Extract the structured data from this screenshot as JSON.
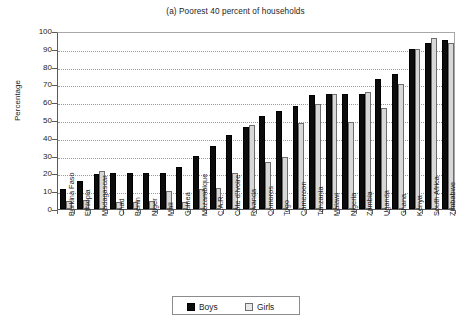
{
  "chart_data": {
    "type": "bar",
    "title": "(a) Poorest 40 percent of households",
    "xlabel": "",
    "ylabel": "Percentage",
    "ylim": [
      0,
      100
    ],
    "ytick_step": 10,
    "yticks": [
      0,
      10,
      20,
      30,
      40,
      50,
      60,
      70,
      80,
      90,
      100
    ],
    "grid": true,
    "legend_position": "bottom-center",
    "categories": [
      "Burkina Faso",
      "Ethiopia",
      "Madagascar",
      "Chad",
      "Benin",
      "Niger",
      "Mali",
      "Guinea",
      "Mozambique",
      "C.A.R.",
      "Côte d'Ivoire",
      "Rwanda",
      "Comoros",
      "Togo",
      "Cameroon",
      "Tanzania",
      "Malawi",
      "Nigeria",
      "Zambia",
      "Uganda",
      "Ghana",
      "Kenya",
      "South Africa",
      "Zimbabwe"
    ],
    "series": [
      {
        "name": "Boys",
        "color": "#0c0c0c",
        "values": [
          11.0,
          15.8,
          19.7,
          20.1,
          20.5,
          20.5,
          20.5,
          23.6,
          30.0,
          35.6,
          41.8,
          46.2,
          52.4,
          55.0,
          57.6,
          64.3,
          64.4,
          64.4,
          64.8,
          73.2,
          76.0,
          90.0,
          93.2,
          95.2
        ]
      },
      {
        "name": "Girls",
        "color": "#d8d8d8",
        "values": [
          4.7,
          5.1,
          21.6,
          3.8,
          3.9,
          4.7,
          10.4,
          4.0,
          11.0,
          12.0,
          20.5,
          47.4,
          26.3,
          29.5,
          48.5,
          58.9,
          64.7,
          48.7,
          65.5,
          57.0,
          70.4,
          90.1,
          96.2,
          93.3
        ]
      }
    ]
  },
  "legend": {
    "entries": [
      {
        "label": "Boys",
        "swatch": "black-square-icon"
      },
      {
        "label": "Girls",
        "swatch": "light-square-icon"
      }
    ]
  },
  "axis": {
    "y_title": "Percentage"
  }
}
